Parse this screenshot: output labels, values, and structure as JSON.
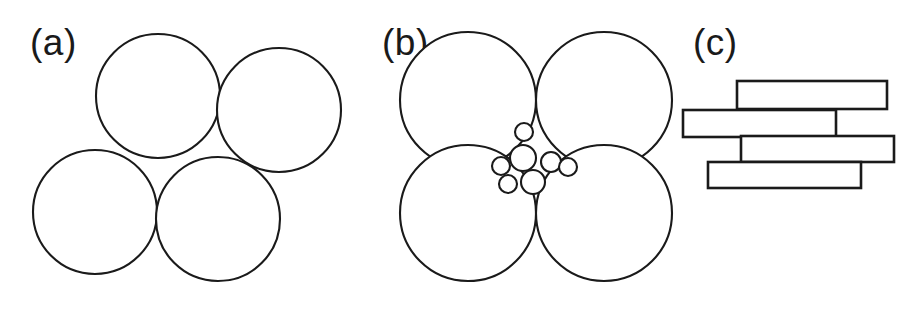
{
  "figure": {
    "width": 923,
    "height": 311,
    "background_color": "#ffffff",
    "stroke_color": "#1a1a1a",
    "fill_color": "#ffffff"
  },
  "panels": [
    {
      "id": "a",
      "label": "(a)",
      "label_x": 30,
      "label_y": 55,
      "type": "monodisperse-spheres",
      "description": "Four equal circles in loose, slightly rotated square packing with open interstitial void"
    },
    {
      "id": "b",
      "label": "(b)",
      "label_x": 382,
      "label_y": 55,
      "type": "bimodal-spheres",
      "description": "Four equal circles in tight square packing with small polydisperse circles filling the central interstitial void"
    },
    {
      "id": "c",
      "label": "(c)",
      "label_x": 693,
      "label_y": 55,
      "type": "platelets",
      "description": "Four staggered rectangular platelets stacked with horizontal offsets"
    }
  ],
  "chart_data": {
    "type": "diagram",
    "title": "",
    "panel_a": {
      "label": "(a)",
      "circles": [
        {
          "cx": 158,
          "cy": 96,
          "r": 62
        },
        {
          "cx": 279,
          "cy": 110,
          "r": 62
        },
        {
          "cx": 95,
          "cy": 212,
          "r": 62
        },
        {
          "cx": 218,
          "cy": 219,
          "r": 62
        }
      ]
    },
    "panel_b": {
      "label": "(b)",
      "large_circles": [
        {
          "cx": 468,
          "cy": 100,
          "r": 68
        },
        {
          "cx": 604,
          "cy": 100,
          "r": 68
        },
        {
          "cx": 468,
          "cy": 213,
          "r": 68
        },
        {
          "cx": 604,
          "cy": 213,
          "r": 68
        }
      ],
      "small_circles": [
        {
          "cx": 524,
          "cy": 132,
          "r": 9
        },
        {
          "cx": 523,
          "cy": 158,
          "r": 13
        },
        {
          "cx": 551,
          "cy": 162,
          "r": 10
        },
        {
          "cx": 568,
          "cy": 167,
          "r": 9
        },
        {
          "cx": 501,
          "cy": 166,
          "r": 9
        },
        {
          "cx": 508,
          "cy": 184,
          "r": 9
        },
        {
          "cx": 533,
          "cy": 182,
          "r": 12
        }
      ]
    },
    "panel_c": {
      "label": "(c)",
      "rectangles": [
        {
          "x": 737,
          "y": 81,
          "width": 150,
          "height": 28
        },
        {
          "x": 683,
          "y": 110,
          "width": 153,
          "height": 27
        },
        {
          "x": 741,
          "y": 136,
          "width": 153,
          "height": 26
        },
        {
          "x": 708,
          "y": 162,
          "width": 153,
          "height": 26
        }
      ]
    }
  }
}
